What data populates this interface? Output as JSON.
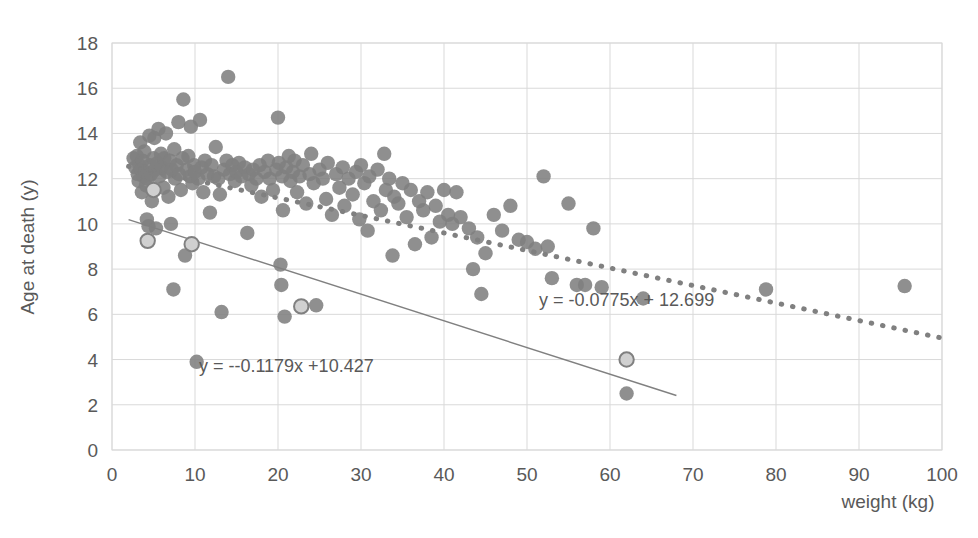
{
  "chart_data": {
    "type": "scatter",
    "title": "",
    "xlabel": "weight (kg)",
    "ylabel": "Age at death (y)",
    "xlim": [
      0,
      100
    ],
    "ylim": [
      0,
      18
    ],
    "xticks": [
      0,
      10,
      20,
      30,
      40,
      50,
      60,
      70,
      80,
      90,
      100
    ],
    "yticks": [
      0,
      2,
      4,
      6,
      8,
      10,
      12,
      14,
      16,
      18
    ],
    "grid": true,
    "legend": "none",
    "marker_color": "#808080",
    "highlight_marker_fill": "#d0d0d0",
    "highlight_marker_stroke": "#808080",
    "series": [
      {
        "name": "main",
        "marker": "circle-filled-gray",
        "points": [
          [
            2.6,
            12.9
          ],
          [
            2.8,
            12.5
          ],
          [
            3.0,
            13.0
          ],
          [
            3.1,
            12.2
          ],
          [
            3.2,
            11.9
          ],
          [
            3.3,
            12.6
          ],
          [
            3.4,
            13.6
          ],
          [
            3.5,
            12.4
          ],
          [
            3.6,
            11.4
          ],
          [
            3.7,
            12.8
          ],
          [
            3.8,
            12.1
          ],
          [
            3.9,
            13.2
          ],
          [
            4.0,
            12.3
          ],
          [
            4.1,
            11.7
          ],
          [
            4.2,
            10.2
          ],
          [
            4.3,
            12.0
          ],
          [
            4.4,
            9.9
          ],
          [
            4.5,
            13.9
          ],
          [
            4.6,
            12.6
          ],
          [
            4.7,
            12.2
          ],
          [
            4.8,
            11.0
          ],
          [
            5.0,
            12.9
          ],
          [
            5.1,
            13.8
          ],
          [
            5.2,
            12.4
          ],
          [
            5.3,
            9.8
          ],
          [
            5.5,
            12.7
          ],
          [
            5.6,
            14.2
          ],
          [
            5.7,
            12.1
          ],
          [
            5.9,
            13.1
          ],
          [
            6.0,
            12.5
          ],
          [
            6.2,
            11.6
          ],
          [
            6.3,
            12.9
          ],
          [
            6.5,
            14.0
          ],
          [
            6.6,
            12.3
          ],
          [
            6.8,
            11.2
          ],
          [
            7.0,
            12.8
          ],
          [
            7.1,
            10.0
          ],
          [
            7.2,
            12.4
          ],
          [
            7.4,
            7.1
          ],
          [
            7.5,
            13.3
          ],
          [
            7.6,
            12.0
          ],
          [
            7.8,
            12.6
          ],
          [
            8.0,
            14.5
          ],
          [
            8.1,
            12.2
          ],
          [
            8.3,
            11.5
          ],
          [
            8.5,
            12.9
          ],
          [
            8.6,
            15.5
          ],
          [
            8.8,
            8.6
          ],
          [
            9.0,
            12.4
          ],
          [
            9.2,
            13.0
          ],
          [
            9.4,
            12.1
          ],
          [
            9.5,
            14.3
          ],
          [
            9.7,
            11.8
          ],
          [
            9.9,
            12.6
          ],
          [
            10.0,
            12.3
          ],
          [
            10.2,
            3.9
          ],
          [
            10.4,
            12.0
          ],
          [
            10.6,
            14.6
          ],
          [
            10.8,
            12.5
          ],
          [
            11.0,
            11.4
          ],
          [
            11.2,
            12.8
          ],
          [
            11.5,
            12.2
          ],
          [
            11.8,
            10.5
          ],
          [
            12.0,
            12.6
          ],
          [
            12.3,
            12.1
          ],
          [
            12.5,
            13.4
          ],
          [
            12.8,
            12.0
          ],
          [
            13.0,
            11.3
          ],
          [
            13.2,
            6.1
          ],
          [
            13.5,
            12.4
          ],
          [
            13.8,
            12.8
          ],
          [
            14.0,
            16.5
          ],
          [
            14.2,
            12.2
          ],
          [
            14.5,
            12.6
          ],
          [
            14.8,
            11.9
          ],
          [
            15.0,
            12.3
          ],
          [
            15.3,
            12.7
          ],
          [
            15.6,
            12.1
          ],
          [
            16.0,
            12.5
          ],
          [
            16.3,
            9.6
          ],
          [
            16.5,
            12.2
          ],
          [
            16.8,
            11.7
          ],
          [
            17.0,
            12.4
          ],
          [
            17.4,
            12.0
          ],
          [
            17.8,
            12.6
          ],
          [
            18.0,
            11.2
          ],
          [
            18.4,
            12.3
          ],
          [
            18.8,
            12.8
          ],
          [
            19.0,
            12.0
          ],
          [
            19.4,
            11.5
          ],
          [
            19.8,
            12.4
          ],
          [
            20.0,
            14.7
          ],
          [
            20.1,
            12.7
          ],
          [
            20.3,
            8.2
          ],
          [
            20.4,
            7.3
          ],
          [
            20.5,
            12.1
          ],
          [
            20.6,
            10.6
          ],
          [
            20.8,
            5.9
          ],
          [
            21.0,
            12.5
          ],
          [
            21.3,
            13.0
          ],
          [
            21.5,
            11.9
          ],
          [
            21.8,
            12.3
          ],
          [
            22.0,
            12.8
          ],
          [
            22.3,
            11.4
          ],
          [
            22.6,
            12.1
          ],
          [
            23.0,
            12.6
          ],
          [
            23.4,
            10.9
          ],
          [
            23.8,
            12.2
          ],
          [
            24.0,
            13.1
          ],
          [
            24.3,
            11.8
          ],
          [
            24.6,
            6.4
          ],
          [
            25.0,
            12.4
          ],
          [
            25.4,
            12.0
          ],
          [
            25.8,
            11.1
          ],
          [
            26.0,
            12.7
          ],
          [
            26.5,
            10.4
          ],
          [
            27.0,
            12.2
          ],
          [
            27.4,
            11.6
          ],
          [
            27.8,
            12.5
          ],
          [
            28.0,
            10.8
          ],
          [
            28.5,
            12.0
          ],
          [
            29.0,
            11.3
          ],
          [
            29.4,
            12.3
          ],
          [
            29.8,
            10.2
          ],
          [
            30.0,
            12.6
          ],
          [
            30.4,
            11.8
          ],
          [
            30.8,
            9.7
          ],
          [
            31.0,
            12.1
          ],
          [
            31.5,
            11.0
          ],
          [
            32.0,
            12.4
          ],
          [
            32.4,
            10.6
          ],
          [
            32.8,
            13.1
          ],
          [
            33.0,
            11.5
          ],
          [
            33.4,
            12.0
          ],
          [
            33.8,
            8.6
          ],
          [
            34.0,
            11.2
          ],
          [
            34.5,
            10.9
          ],
          [
            35.0,
            11.8
          ],
          [
            35.5,
            10.3
          ],
          [
            36.0,
            11.5
          ],
          [
            36.5,
            9.1
          ],
          [
            37.0,
            11.0
          ],
          [
            37.5,
            10.6
          ],
          [
            38.0,
            11.4
          ],
          [
            38.5,
            9.4
          ],
          [
            39.0,
            10.8
          ],
          [
            39.5,
            10.1
          ],
          [
            40.0,
            11.5
          ],
          [
            40.5,
            10.4
          ],
          [
            41.0,
            10.0
          ],
          [
            41.5,
            11.4
          ],
          [
            42.0,
            10.3
          ],
          [
            43.0,
            9.8
          ],
          [
            43.5,
            8.0
          ],
          [
            44.0,
            9.4
          ],
          [
            44.5,
            6.9
          ],
          [
            45.0,
            8.7
          ],
          [
            46.0,
            10.4
          ],
          [
            47.0,
            9.7
          ],
          [
            48.0,
            10.8
          ],
          [
            49.0,
            9.3
          ],
          [
            50.0,
            9.2
          ],
          [
            51.0,
            8.9
          ],
          [
            52.0,
            12.1
          ],
          [
            52.5,
            9.0
          ],
          [
            53.0,
            7.6
          ],
          [
            55.0,
            10.9
          ],
          [
            56.0,
            7.3
          ],
          [
            57.0,
            7.3
          ],
          [
            58.0,
            9.8
          ],
          [
            59.0,
            7.2
          ],
          [
            62.0,
            2.5
          ],
          [
            64.0,
            6.7
          ],
          [
            78.8,
            7.1
          ],
          [
            95.5,
            7.25
          ]
        ]
      },
      {
        "name": "highlighted",
        "marker": "circle-light-outlined",
        "points": [
          [
            5.0,
            11.5
          ],
          [
            4.3,
            9.25
          ],
          [
            9.6,
            9.1
          ],
          [
            22.8,
            6.35
          ],
          [
            62.0,
            4.0
          ]
        ]
      }
    ],
    "trendlines": [
      {
        "name": "dotted-thick-trend",
        "style": "dotted",
        "equation": "y = -0.0775x + 12.699",
        "slope": -0.0775,
        "intercept": 12.699,
        "x_start": 2,
        "x_end": 100,
        "label_x": 62,
        "label_y": 6.35,
        "color": "#808080"
      },
      {
        "name": "solid-thin-trend",
        "style": "solid",
        "equation": "y = --0.1179x +10.427",
        "slope": -0.1179,
        "intercept": 10.427,
        "x_start": 2,
        "x_end": 68,
        "label_x": 21,
        "label_y": 3.45,
        "color": "#808080"
      }
    ]
  },
  "axes": {
    "y_title": "Age at death (y)",
    "x_title": "weight (kg)",
    "y_tick_labels": [
      "18",
      "16",
      "14",
      "12",
      "10",
      "8",
      "6",
      "4",
      "2",
      "0"
    ],
    "x_tick_labels": [
      "0",
      "10",
      "20",
      "30",
      "40",
      "50",
      "60",
      "70",
      "80",
      "90",
      "100"
    ]
  },
  "annotations": {
    "eq_upper": "y = -0.0775x + 12.699",
    "eq_lower": "y = --0.1179x +10.427"
  },
  "colors": {
    "marker": "#808080",
    "highlight_fill": "#d0d0d0",
    "grid": "#d9d9d9",
    "text": "#595959",
    "plot_border": "#d9d9d9"
  }
}
